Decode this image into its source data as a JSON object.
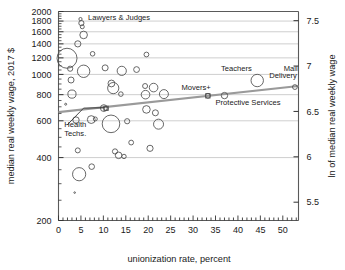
{
  "chart_data": {
    "type": "scatter",
    "title": "",
    "xlabel": "unionization rate, percent",
    "ylabel": "median real weekly wage, 2017 $",
    "y2label": "ln of median real weekly wage",
    "xlim": [
      0,
      53.5
    ],
    "ylim": [
      200,
      2000
    ],
    "yscale": "log",
    "grid": "horizontal",
    "legend": "none",
    "xticks": [
      0,
      5,
      10,
      15,
      20,
      25,
      30,
      35,
      40,
      45,
      50
    ],
    "xticklabels": [
      "0",
      "5",
      "10",
      "15",
      "20",
      "25",
      "30",
      "35",
      "40",
      "45",
      "50"
    ],
    "xminor_step": 1,
    "yticks": [
      200,
      400,
      600,
      800,
      1000,
      1200,
      1400,
      1600,
      1800,
      2000
    ],
    "yticklabels": [
      "200",
      "400",
      "600",
      "800",
      "1000",
      "1200",
      "1400",
      "1600",
      "1800",
      "2000"
    ],
    "y2ticks": [
      5.5,
      6,
      6.5,
      7,
      7.5
    ],
    "y2ticklabels": [
      "5.5",
      "6",
      "6.5",
      "7",
      "7.5"
    ],
    "marker_shape": "open-circle",
    "size_encodes": "employment share",
    "trendline": {
      "x": [
        0,
        53.5
      ],
      "y": [
        660,
        880
      ],
      "color": "#9a9a9a",
      "width": 2.2
    },
    "annotations": [
      {
        "label": "Lawyers & Judges",
        "x": 6.6,
        "y": 1830,
        "anchor": "start",
        "leader": false
      },
      {
        "label": "Teachers",
        "x": 36.2,
        "y": 1040,
        "anchor": "start",
        "leader": false
      },
      {
        "label": "Mail",
        "x": 50.2,
        "y": 1040,
        "anchor": "start",
        "leader": false
      },
      {
        "label": "Delivery",
        "x": 47.0,
        "y": 960,
        "anchor": "start",
        "leader": false
      },
      {
        "label": "Movers+",
        "x": 27.4,
        "y": 845,
        "anchor": "start",
        "leader": false
      },
      {
        "label": "Protective Services",
        "x": 35.0,
        "y": 718,
        "anchor": "start",
        "leader": false
      },
      {
        "label": "Health",
        "x": 1.3,
        "y": 560,
        "anchor": "start",
        "leader": true
      },
      {
        "label": "Techs.",
        "x": 1.3,
        "y": 505,
        "anchor": "start",
        "leader": false
      }
    ],
    "leader_line": {
      "from": [
        1.9,
        572
      ],
      "to": [
        6.2,
        688
      ],
      "color": "#333333"
    },
    "points": [
      {
        "x": 4.9,
        "y": 1840,
        "r": 1.6
      },
      {
        "x": 5.1,
        "y": 1760,
        "r": 2.6
      },
      {
        "x": 5.3,
        "y": 1690,
        "r": 2.0
      },
      {
        "x": 5.6,
        "y": 1545,
        "r": 3.8
      },
      {
        "x": 4.3,
        "y": 1400,
        "r": 3.1
      },
      {
        "x": 7.6,
        "y": 1255,
        "r": 2.3
      },
      {
        "x": 1.9,
        "y": 1195,
        "r": 10.0
      },
      {
        "x": 2.6,
        "y": 1065,
        "r": 2.6
      },
      {
        "x": 5.6,
        "y": 1035,
        "r": 6.2
      },
      {
        "x": 10.4,
        "y": 1075,
        "r": 3.0
      },
      {
        "x": 14.1,
        "y": 1040,
        "r": 4.6
      },
      {
        "x": 17.4,
        "y": 1055,
        "r": 2.9
      },
      {
        "x": 19.6,
        "y": 1245,
        "r": 2.4
      },
      {
        "x": 2.8,
        "y": 940,
        "r": 3.0
      },
      {
        "x": 12.2,
        "y": 860,
        "r": 5.6
      },
      {
        "x": 11.8,
        "y": 905,
        "r": 3.4
      },
      {
        "x": 19.3,
        "y": 880,
        "r": 2.5
      },
      {
        "x": 21.2,
        "y": 865,
        "r": 4.3
      },
      {
        "x": 3.0,
        "y": 805,
        "r": 4.1
      },
      {
        "x": 13.9,
        "y": 805,
        "r": 2.3
      },
      {
        "x": 19.4,
        "y": 800,
        "r": 4.3
      },
      {
        "x": 23.5,
        "y": 805,
        "r": 4.5
      },
      {
        "x": 33.3,
        "y": 790,
        "r": 2.4
      },
      {
        "x": 37.0,
        "y": 792,
        "r": 3.2
      },
      {
        "x": 52.7,
        "y": 870,
        "r": 2.4
      },
      {
        "x": 44.3,
        "y": 935,
        "r": 6.2
      },
      {
        "x": 1.6,
        "y": 720,
        "r": 1.0
      },
      {
        "x": 10.1,
        "y": 690,
        "r": 3.4
      },
      {
        "x": 10.6,
        "y": 688,
        "r": 2.0
      },
      {
        "x": 3.9,
        "y": 605,
        "r": 3.2
      },
      {
        "x": 7.3,
        "y": 608,
        "r": 3.9
      },
      {
        "x": 8.2,
        "y": 612,
        "r": 2.0
      },
      {
        "x": 11.7,
        "y": 580,
        "r": 8.8
      },
      {
        "x": 15.3,
        "y": 597,
        "r": 2.6
      },
      {
        "x": 19.6,
        "y": 680,
        "r": 3.8
      },
      {
        "x": 21.6,
        "y": 655,
        "r": 3.0
      },
      {
        "x": 22.3,
        "y": 578,
        "r": 5.0
      },
      {
        "x": 16.2,
        "y": 472,
        "r": 2.4
      },
      {
        "x": 20.4,
        "y": 443,
        "r": 3.1
      },
      {
        "x": 4.3,
        "y": 433,
        "r": 2.5
      },
      {
        "x": 12.6,
        "y": 428,
        "r": 2.6
      },
      {
        "x": 13.4,
        "y": 410,
        "r": 3.3
      },
      {
        "x": 14.6,
        "y": 405,
        "r": 2.2
      },
      {
        "x": 4.6,
        "y": 333,
        "r": 6.6
      },
      {
        "x": 7.4,
        "y": 362,
        "r": 2.8
      },
      {
        "x": 3.6,
        "y": 272,
        "r": 0.8
      }
    ]
  }
}
